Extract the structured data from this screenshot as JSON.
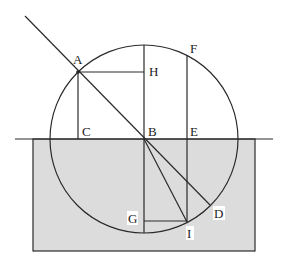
{
  "diagram": {
    "colors": {
      "medium_fill": "#dcdcdc",
      "line": "#2a2a2a",
      "background": "#ffffff"
    },
    "labels": {
      "A": "A",
      "B": "B",
      "C": "C",
      "D": "D",
      "E": "E",
      "F": "F",
      "G": "G",
      "H": "H",
      "I": "I"
    }
  }
}
